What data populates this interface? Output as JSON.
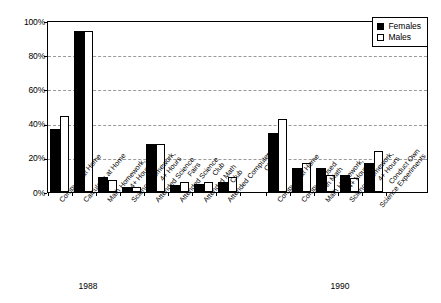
{
  "chart_data": {
    "type": "bar",
    "title": "",
    "subtitle": "",
    "xlabel": "",
    "ylabel": "",
    "ylim": [
      0,
      100
    ],
    "y_tick_labels": [
      "0%",
      "20%",
      "40%",
      "60%",
      "80%",
      "100%"
    ],
    "y_tick_values": [
      0,
      20,
      40,
      60,
      80,
      100
    ],
    "grid": "horizontal-dashed",
    "legend_position": "top-right",
    "legend": [
      "Females",
      "Males"
    ],
    "series": [
      {
        "name": "Females",
        "color": "#000000",
        "values": [
          37,
          95,
          9,
          3,
          28,
          4,
          5,
          6,
          35,
          14,
          14,
          10,
          17
        ]
      },
      {
        "name": "Males",
        "color": "#ffffff",
        "values": [
          45,
          95,
          7,
          3,
          28,
          6,
          6,
          9,
          43,
          17,
          10,
          8,
          24
        ]
      }
    ],
    "categories": [
      "Computer at Home",
      "Calculator at Home",
      "Math Homework, 4+ Hours",
      "Science Homework, 4+ Hours",
      "Attended Science Fairs",
      "Attended Science Club",
      "Attended Math Club",
      "Attended Computer Club",
      "Computer at Home",
      "Computer Used in Math",
      "Math Homework, 4+ Hours",
      "Science Homework, 4+ Hours",
      "Conduct Own Science Experiments"
    ],
    "category_lines": [
      [
        "Computer at Home"
      ],
      [
        "Calculator at Home"
      ],
      [
        "Math Homework,",
        "4+ Hours"
      ],
      [
        "Science Homework,",
        "4+ Hours"
      ],
      [
        "Attended Science",
        "Fairs"
      ],
      [
        "Attended Science",
        "Club"
      ],
      [
        "Attended Math",
        "Club"
      ],
      [
        "Attended Computer",
        "Club"
      ],
      [
        "Computer at Home"
      ],
      [
        "Computer Used",
        "in Math"
      ],
      [
        "Math Homework,",
        "4+ Hours"
      ],
      [
        "Science Homework,",
        "4+ Hours"
      ],
      [
        "Conduct Own",
        "Science Experiments"
      ]
    ],
    "groups": [
      {
        "label": "1988",
        "category_indices": [
          0,
          1,
          2,
          3,
          4,
          5,
          6,
          7
        ]
      },
      {
        "label": "1990",
        "category_indices": [
          8,
          9,
          10,
          11,
          12
        ]
      }
    ]
  }
}
